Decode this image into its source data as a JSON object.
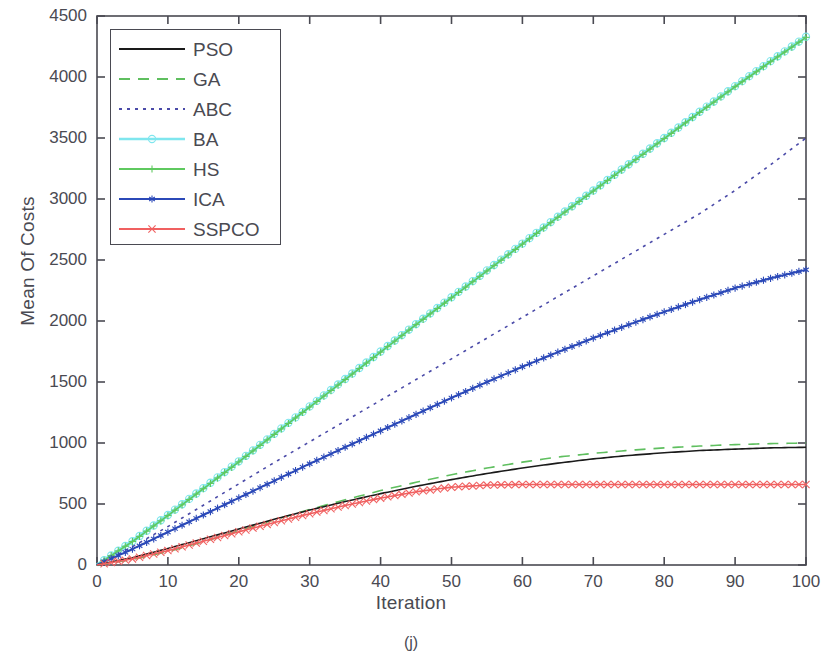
{
  "figure": {
    "caption": "(j)",
    "xlabel": "Iteration",
    "ylabel": "Mean Of Costs"
  },
  "axes": {
    "y_ticks": [
      "0",
      "500",
      "1000",
      "1500",
      "2000",
      "2500",
      "3000",
      "3500",
      "4000",
      "4500"
    ],
    "x_ticks": [
      "0",
      "10",
      "20",
      "30",
      "40",
      "50",
      "60",
      "70",
      "80",
      "90",
      "100"
    ]
  },
  "legend": {
    "entries": [
      {
        "label": "PSO",
        "color": "#1a1a1a",
        "style": "solid",
        "marker": "none"
      },
      {
        "label": "GA",
        "color": "#5fbf5f",
        "style": "dashed",
        "marker": "none"
      },
      {
        "label": "ABC",
        "color": "#4a4aa8",
        "style": "dotted",
        "marker": "none"
      },
      {
        "label": "BA",
        "color": "#7fe6ee",
        "style": "solid",
        "marker": "circle"
      },
      {
        "label": "HS",
        "color": "#5fc95f",
        "style": "solid",
        "marker": "plus"
      },
      {
        "label": "ICA",
        "color": "#2b49b8",
        "style": "solid",
        "marker": "asterisk"
      },
      {
        "label": "SSPCO",
        "color": "#f06060",
        "style": "solid",
        "marker": "x"
      }
    ]
  },
  "chart_data": {
    "type": "line",
    "title": "",
    "xlabel": "Iteration",
    "ylabel": "Mean Of Costs",
    "xlim": [
      0,
      100
    ],
    "ylim": [
      0,
      4500
    ],
    "grid": false,
    "legend_position": "upper-left",
    "x": [
      0,
      5,
      10,
      15,
      20,
      25,
      30,
      35,
      40,
      45,
      50,
      55,
      60,
      65,
      70,
      75,
      80,
      85,
      90,
      95,
      100
    ],
    "series": [
      {
        "name": "PSO",
        "color": "#1a1a1a",
        "style": "solid",
        "marker": "none",
        "values": [
          0,
          60,
          135,
          215,
          295,
          375,
          450,
          520,
          585,
          645,
          700,
          750,
          795,
          835,
          870,
          898,
          920,
          938,
          950,
          960,
          965
        ]
      },
      {
        "name": "GA",
        "color": "#5fbf5f",
        "style": "dashed",
        "marker": "none",
        "values": [
          0,
          45,
          110,
          190,
          280,
          370,
          455,
          535,
          610,
          678,
          740,
          795,
          843,
          885,
          915,
          940,
          960,
          975,
          987,
          995,
          1000
        ]
      },
      {
        "name": "ABC",
        "color": "#4a4aa8",
        "style": "dotted",
        "marker": "none",
        "values": [
          0,
          150,
          315,
          490,
          665,
          840,
          1010,
          1180,
          1350,
          1520,
          1690,
          1860,
          2030,
          2200,
          2370,
          2540,
          2710,
          2880,
          3070,
          3280,
          3500
        ]
      },
      {
        "name": "BA",
        "color": "#7fe6ee",
        "style": "solid",
        "marker": "circle",
        "values": [
          0,
          195,
          410,
          630,
          850,
          1075,
          1300,
          1525,
          1750,
          1975,
          2195,
          2415,
          2635,
          2855,
          3070,
          3285,
          3500,
          3715,
          3925,
          4130,
          4330
        ]
      },
      {
        "name": "HS",
        "color": "#5fc95f",
        "style": "solid",
        "marker": "plus",
        "values": [
          0,
          192,
          405,
          625,
          845,
          1070,
          1295,
          1520,
          1745,
          1970,
          2190,
          2410,
          2630,
          2850,
          3065,
          3280,
          3495,
          3710,
          3920,
          4125,
          4325
        ]
      },
      {
        "name": "ICA",
        "color": "#2b49b8",
        "style": "solid",
        "marker": "asterisk",
        "values": [
          0,
          130,
          270,
          410,
          550,
          690,
          830,
          965,
          1100,
          1235,
          1370,
          1500,
          1625,
          1745,
          1860,
          1970,
          2075,
          2175,
          2270,
          2350,
          2420
        ]
      },
      {
        "name": "SSPCO",
        "color": "#f06060",
        "style": "solid",
        "marker": "x",
        "values": [
          0,
          50,
          118,
          195,
          272,
          348,
          420,
          488,
          548,
          600,
          638,
          655,
          660,
          660,
          660,
          660,
          660,
          660,
          660,
          660,
          660
        ]
      }
    ]
  }
}
